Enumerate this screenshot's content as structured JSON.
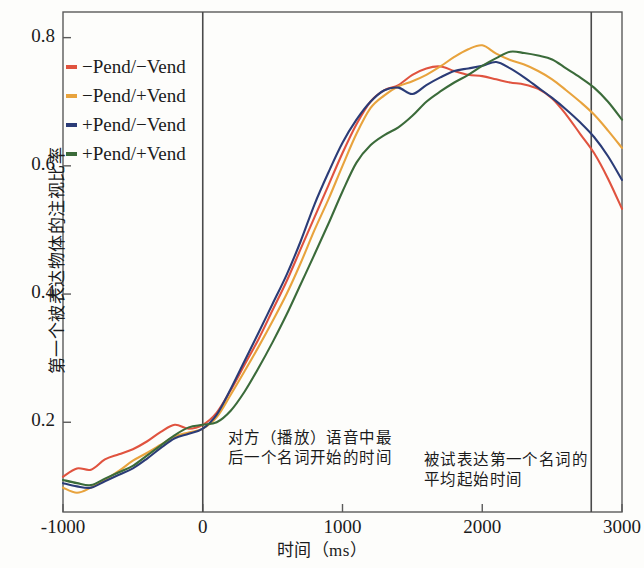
{
  "axes": {
    "ylabel": "第一个被表达物体的注视比率",
    "xlabel": "时间（ms）",
    "yticks": [
      "0.8",
      "0.6",
      "0.4",
      "0.2"
    ],
    "ytick_values": [
      0.8,
      0.6,
      0.4,
      0.2
    ],
    "xticks": [
      "-1000",
      "0",
      "1000",
      "2000",
      "3000"
    ],
    "xtick_values": [
      -1000,
      0,
      1000,
      2000,
      3000
    ]
  },
  "legend": {
    "items": [
      {
        "label": "−Pend/−Vend",
        "color": "#e0533f"
      },
      {
        "label": "−Pend/+Vend",
        "color": "#e8a33d"
      },
      {
        "label": "+Pend/−Vend",
        "color": "#2b3c77"
      },
      {
        "label": "+Pend/+Vend",
        "color": "#3b6b3a"
      }
    ]
  },
  "annotations": [
    {
      "name": "onset-last-noun-partner",
      "text": "对方（播放）语音中最后一个名词开始的时间",
      "x_ms": 0
    },
    {
      "name": "mean-onset-first-noun-subject",
      "text": "被试表达第一个名词的平均起始时间",
      "x_ms": 2780
    }
  ],
  "reference_lines": [
    0,
    2780
  ],
  "chart_data": {
    "type": "line",
    "title": "",
    "xlabel": "时间（ms）",
    "ylabel": "第一个被表达物体的注视比率",
    "xlim": [
      -1000,
      3000
    ],
    "ylim": [
      0.06,
      0.84
    ],
    "grid": false,
    "legend_position": "upper-left",
    "x": [
      -1000,
      -900,
      -800,
      -700,
      -600,
      -500,
      -400,
      -300,
      -200,
      -100,
      0,
      100,
      200,
      300,
      400,
      500,
      600,
      700,
      800,
      900,
      1000,
      1100,
      1200,
      1300,
      1400,
      1500,
      1600,
      1700,
      1800,
      1900,
      2000,
      2100,
      2200,
      2300,
      2400,
      2500,
      2600,
      2700,
      2800,
      2900,
      3000
    ],
    "series": [
      {
        "name": "−Pend/−Vend",
        "color": "#e0533f",
        "values": [
          0.115,
          0.128,
          0.126,
          0.142,
          0.15,
          0.158,
          0.17,
          0.185,
          0.196,
          0.19,
          0.196,
          0.215,
          0.25,
          0.29,
          0.33,
          0.375,
          0.42,
          0.47,
          0.52,
          0.57,
          0.62,
          0.665,
          0.7,
          0.718,
          0.726,
          0.742,
          0.752,
          0.755,
          0.748,
          0.742,
          0.74,
          0.735,
          0.73,
          0.727,
          0.72,
          0.705,
          0.68,
          0.65,
          0.62,
          0.58,
          0.533
        ]
      },
      {
        "name": "−Pend/+Vend",
        "color": "#e8a33d",
        "values": [
          0.098,
          0.09,
          0.098,
          0.11,
          0.124,
          0.14,
          0.152,
          0.165,
          0.178,
          0.184,
          0.19,
          0.208,
          0.243,
          0.28,
          0.318,
          0.358,
          0.4,
          0.448,
          0.5,
          0.548,
          0.6,
          0.65,
          0.69,
          0.71,
          0.724,
          0.732,
          0.742,
          0.755,
          0.77,
          0.782,
          0.788,
          0.775,
          0.765,
          0.758,
          0.748,
          0.735,
          0.718,
          0.7,
          0.68,
          0.655,
          0.628
        ]
      },
      {
        "name": "+Pend/−Vend",
        "color": "#2b3c77",
        "values": [
          0.105,
          0.1,
          0.098,
          0.108,
          0.118,
          0.128,
          0.143,
          0.16,
          0.175,
          0.182,
          0.19,
          0.212,
          0.252,
          0.296,
          0.34,
          0.385,
          0.43,
          0.482,
          0.54,
          0.59,
          0.636,
          0.672,
          0.7,
          0.718,
          0.722,
          0.712,
          0.726,
          0.738,
          0.748,
          0.752,
          0.756,
          0.762,
          0.752,
          0.738,
          0.722,
          0.706,
          0.688,
          0.668,
          0.645,
          0.615,
          0.578
        ]
      },
      {
        "name": "+Pend/+Vend",
        "color": "#3b6b3a",
        "values": [
          0.11,
          0.105,
          0.102,
          0.112,
          0.122,
          0.132,
          0.148,
          0.164,
          0.18,
          0.192,
          0.196,
          0.2,
          0.218,
          0.248,
          0.285,
          0.325,
          0.368,
          0.415,
          0.462,
          0.51,
          0.56,
          0.605,
          0.632,
          0.648,
          0.66,
          0.678,
          0.7,
          0.716,
          0.73,
          0.742,
          0.756,
          0.768,
          0.778,
          0.776,
          0.772,
          0.766,
          0.752,
          0.738,
          0.722,
          0.7,
          0.672
        ]
      }
    ]
  }
}
